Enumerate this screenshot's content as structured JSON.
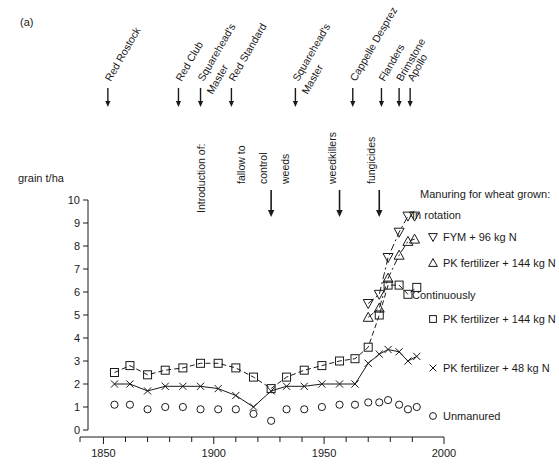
{
  "panel": {
    "label": "(a)"
  },
  "axes": {
    "y_title": "grain t/ha",
    "y_ticks": [
      "0",
      "1",
      "2",
      "3",
      "4",
      "5",
      "6",
      "7",
      "8",
      "9",
      "10"
    ],
    "x_ticks": [
      "1850",
      "1900",
      "1950",
      "2000"
    ],
    "x_minor_step": 10,
    "xlim": [
      1843,
      1998
    ],
    "ylim": [
      0,
      10
    ]
  },
  "varieties": [
    {
      "name": "Red Rostock",
      "year": 1852
    },
    {
      "name": "Red Club",
      "year": 1884
    },
    {
      "name": "Squarehead's Master",
      "year": 1894
    },
    {
      "name": "Red Standard",
      "year": 1908
    },
    {
      "name": "Squarehead's Master",
      "year": 1937
    },
    {
      "name": "Cappelle Desprez",
      "year": 1963
    },
    {
      "name": "Flanders",
      "year": 1976
    },
    {
      "name": "Brimstone",
      "year": 1984
    },
    {
      "name": "Apollo",
      "year": 1989
    }
  ],
  "annotations": {
    "intro_label": "Introduction of:",
    "items": [
      {
        "label": "fallow to\ncontrol\nweeds",
        "lines": [
          "fallow to",
          "control",
          "weeds"
        ],
        "year": 1926
      },
      {
        "label": "weedkillers",
        "lines": [
          "weedkillers"
        ],
        "year": 1957
      },
      {
        "label": "fungicides",
        "lines": [
          "fungicides"
        ],
        "year": 1975
      }
    ]
  },
  "legend": {
    "title": "Manuring for wheat grown:",
    "group_rotation": "In rotation",
    "group_continuous": "Continuously",
    "entries": [
      {
        "marker": "triangle-down",
        "label": "FYM + 96 kg N",
        "group": "rotation"
      },
      {
        "marker": "triangle-up",
        "label": "PK fertilizer + 144 kg N",
        "group": "rotation"
      },
      {
        "marker": "square",
        "label": "PK fertilizer + 144 kg N",
        "group": "continuous"
      },
      {
        "marker": "cross",
        "label": "PK fertilizer + 48 kg N",
        "group": "continuous"
      },
      {
        "marker": "circle",
        "label": "Unmanured",
        "group": "continuous"
      }
    ]
  },
  "chart_data": {
    "type": "scatter",
    "title": "",
    "xlabel": "",
    "ylabel": "grain t/ha",
    "xlim": [
      1843,
      1998
    ],
    "ylim": [
      0,
      10
    ],
    "grid": false,
    "legend_position": "right",
    "series": [
      {
        "name": "FYM + 96 kg N (in rotation)",
        "marker": "triangle-down",
        "line": "dash-dot",
        "x": [
          1970,
          1975,
          1979,
          1984,
          1988,
          1991
        ],
        "y": [
          5.5,
          5.9,
          7.5,
          8.6,
          9.3,
          9.3
        ]
      },
      {
        "name": "PK fertilizer + 144 kg N (in rotation)",
        "marker": "triangle-up",
        "line": "dash-dot",
        "x": [
          1970,
          1975,
          1979,
          1984,
          1988,
          1991
        ],
        "y": [
          4.9,
          5.3,
          6.6,
          7.6,
          8.2,
          8.3
        ]
      },
      {
        "name": "PK fertilizer + 144 kg N (continuously)",
        "marker": "square",
        "line": "dashed",
        "x": [
          1855,
          1862,
          1870,
          1878,
          1886,
          1894,
          1902,
          1910,
          1918,
          1926,
          1933,
          1941,
          1949,
          1957,
          1964,
          1970,
          1975,
          1979,
          1984,
          1988,
          1992
        ],
        "y": [
          2.5,
          2.8,
          2.4,
          2.6,
          2.7,
          2.9,
          2.9,
          2.7,
          2.3,
          1.8,
          2.3,
          2.6,
          2.8,
          3.0,
          3.1,
          3.6,
          5.0,
          6.3,
          6.3,
          5.9,
          6.2
        ]
      },
      {
        "name": "PK fertilizer + 48 kg N (continuously)",
        "marker": "cross",
        "line": "solid",
        "x": [
          1855,
          1862,
          1870,
          1878,
          1886,
          1894,
          1902,
          1910,
          1918,
          1926,
          1933,
          1941,
          1949,
          1957,
          1964,
          1970,
          1975,
          1979,
          1984,
          1988,
          1992
        ],
        "y": [
          2.0,
          2.0,
          1.7,
          1.9,
          1.9,
          1.9,
          1.8,
          1.5,
          1.0,
          1.7,
          1.9,
          1.9,
          2.0,
          2.0,
          2.0,
          2.9,
          3.3,
          3.5,
          3.4,
          3.0,
          3.2
        ]
      },
      {
        "name": "Unmanured (continuously)",
        "marker": "circle",
        "line": "none",
        "x": [
          1855,
          1862,
          1870,
          1878,
          1886,
          1894,
          1902,
          1910,
          1918,
          1926,
          1933,
          1941,
          1949,
          1957,
          1964,
          1970,
          1975,
          1979,
          1984,
          1988,
          1992
        ],
        "y": [
          1.1,
          1.1,
          0.9,
          1.0,
          1.0,
          0.9,
          0.9,
          0.9,
          0.7,
          0.4,
          0.9,
          0.9,
          1.0,
          1.1,
          1.1,
          1.2,
          1.2,
          1.3,
          1.1,
          0.9,
          1.0
        ]
      }
    ]
  }
}
